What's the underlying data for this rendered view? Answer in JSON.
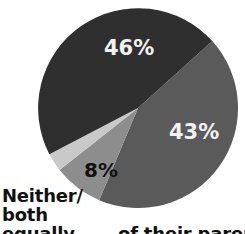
{
  "chart_data": {
    "type": "pie",
    "title": "",
    "subtitle": "",
    "xlabel": "",
    "ylabel": "",
    "grid": false,
    "legend_position": "none",
    "center": {
      "cx": 138,
      "cy": 108,
      "r": 100
    },
    "start_angle_deg": -42,
    "direction": "clockwise",
    "categories": [
      "46%",
      "43%",
      "8%",
      "3%"
    ],
    "values": [
      46,
      43,
      8,
      3
    ],
    "slices": [
      {
        "label": "46%",
        "value": 46,
        "color": "#2f2f2f",
        "label_color": "#f2f2f2",
        "label_shown": true
      },
      {
        "label": "43%",
        "value": 43,
        "color": "#5a5a5a",
        "label_color": "#f2f2f2",
        "label_shown": true
      },
      {
        "label": "8%",
        "value": 8,
        "color": "#8d8d8d",
        "label_color": "#111111",
        "label_shown": true
      },
      {
        "label": "",
        "value": 3,
        "color": "#c9c9c9",
        "label_color": "#111111",
        "label_shown": false
      }
    ],
    "annotations": [
      {
        "name": "neither-both-equally",
        "lines": [
          "Neither/",
          "both",
          "equally"
        ],
        "clipped": true
      }
    ]
  },
  "labels": {
    "slice_46": "46%",
    "slice_43": "43%",
    "slice_8": "8%"
  },
  "caption": {
    "line1": "Neither/",
    "line2": "both",
    "line3": "equally",
    "tail": "of their parent"
  },
  "colors": {
    "slice_dark": "#2f2f2f",
    "slice_medium": "#5a5a5a",
    "slice_light": "#8d8d8d",
    "slice_pale": "#c9c9c9",
    "background": "#ffffff",
    "text_dark": "#111111",
    "text_light": "#f2f2f2"
  }
}
